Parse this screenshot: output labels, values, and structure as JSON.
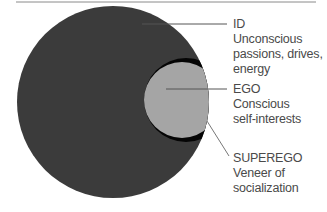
{
  "diagram": {
    "colors": {
      "id": "#3b3b3b",
      "ego": "#a5a5a5",
      "superego": "#050505",
      "lines": "#555555",
      "text": "#4a4a4a",
      "rule": "#8a8a8a"
    },
    "labels": {
      "id": {
        "title": "ID",
        "line1": "Unconscious",
        "line2": "passions, drives,",
        "line3": "energy"
      },
      "ego": {
        "title": "EGO",
        "line1": "Conscious",
        "line2": "self-interests"
      },
      "superego": {
        "title": "SUPEREGO",
        "line1": "Veneer of",
        "line2": "socialization"
      }
    }
  }
}
